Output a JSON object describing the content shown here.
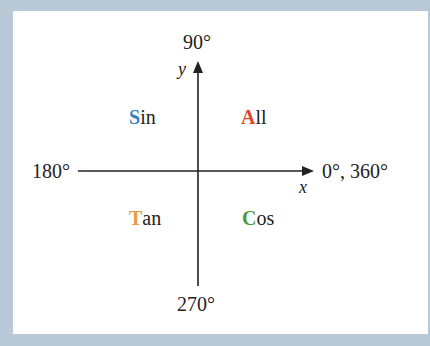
{
  "diagram": {
    "angles": {
      "top": "90°",
      "left": "180°",
      "right": "0°, 360°",
      "bottom": "270°"
    },
    "axes": {
      "x": "x",
      "y": "y"
    },
    "quadrants": [
      {
        "position": "top-left",
        "first": "S",
        "rest": "in",
        "color": "#3b7fc4"
      },
      {
        "position": "top-right",
        "first": "A",
        "rest": "ll",
        "color": "#e0452b"
      },
      {
        "position": "bottom-left",
        "first": "T",
        "rest": "an",
        "color": "#e89a4a"
      },
      {
        "position": "bottom-right",
        "first": "C",
        "rest": "os",
        "color": "#4a9a3c"
      }
    ]
  },
  "colors": {
    "background": "#b9c9d8",
    "panel": "#ffffff",
    "axis": "#222222"
  }
}
